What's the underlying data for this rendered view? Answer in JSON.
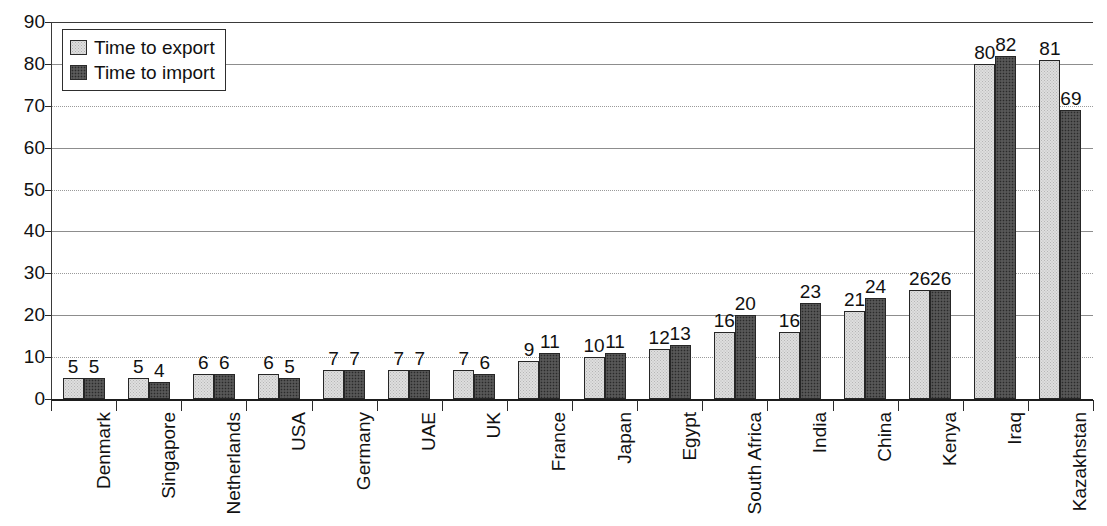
{
  "chart_data": {
    "type": "bar",
    "title": "",
    "subtitle": "",
    "xlabel": "",
    "ylabel": "",
    "ylim": [
      0,
      90
    ],
    "ytick_step": 10,
    "yticks": [
      0,
      10,
      20,
      30,
      40,
      50,
      60,
      70,
      80,
      90
    ],
    "grid": true,
    "grid_axis": "y",
    "legend_position": "top-left",
    "value_labels": true,
    "categories": [
      "Denmark",
      "Singapore",
      "Netherlands",
      "USA",
      "Germany",
      "UAE",
      "UK",
      "France",
      "Japan",
      "Egypt",
      "South Africa",
      "India",
      "China",
      "Kenya",
      "Iraq",
      "Kazakhstan"
    ],
    "series": [
      {
        "name": "Time to export",
        "color": "#dedede",
        "values": [
          5,
          5,
          6,
          6,
          7,
          7,
          7,
          9,
          10,
          12,
          16,
          16,
          21,
          26,
          80,
          81
        ]
      },
      {
        "name": "Time to import",
        "color": "#4c4c4c",
        "values": [
          5,
          4,
          6,
          5,
          7,
          7,
          6,
          11,
          11,
          13,
          20,
          23,
          24,
          26,
          82,
          69
        ]
      }
    ]
  },
  "legend": {
    "items": [
      {
        "label": "Time to export",
        "swatch": "export-swatch"
      },
      {
        "label": "Time to import",
        "swatch": "import-swatch"
      }
    ]
  },
  "colors": {
    "export_fill": "#dedede",
    "import_fill": "#4c4c4c",
    "axis": "#1d1d1d",
    "grid": "#8d8d8d",
    "text": "#111111",
    "background": "#ffffff"
  }
}
